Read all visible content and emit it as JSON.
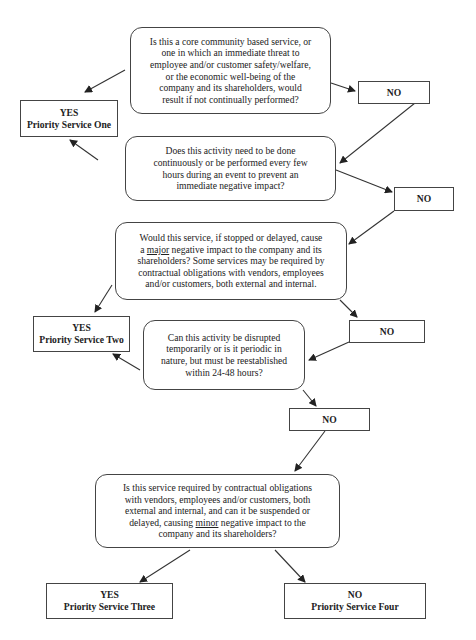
{
  "questions": [
    {
      "id": "q1",
      "lines": [
        "Is this a core community based service, or",
        "one in which an immediate threat to",
        "employee and/or customer safety/welfare,",
        "or the economic well-being of the",
        "company and its shareholders, would",
        "result if not continually performed?"
      ]
    },
    {
      "id": "q2",
      "lines": [
        "Does this activity need to be done",
        "continuously or be performed every few",
        "hours during an event to prevent an",
        "immediate negative impact?"
      ]
    },
    {
      "id": "q3",
      "line1_pre": "Would this service, if stopped or delayed, cause",
      "line2_a": "a ",
      "line2_u": "major",
      "line2_b": " negative impact to the company and its",
      "lines_rest": [
        "shareholders? Some services may be required by",
        "contractual obligations with vendors, employees",
        "and/or customers, both external and internal."
      ]
    },
    {
      "id": "q4",
      "lines": [
        "Can this activity be disrupted",
        "temporarily or is it periodic in",
        "nature, but must be reestablished",
        "within 24-48 hours?"
      ]
    },
    {
      "id": "q5",
      "lines_pre": [
        "Is this service required by contractual obligations",
        "with vendors, employees and/or customers, both",
        "external and internal, and can it be suspended or"
      ],
      "line4_a": "delayed, causing ",
      "line4_u": "minor",
      "line4_b": " negative impact to the",
      "line5": "company and its shareholders?"
    }
  ],
  "results": {
    "yes1": {
      "answer": "YES",
      "label": "Priority Service One"
    },
    "yes2": {
      "answer": "YES",
      "label": "Priority Service Two"
    },
    "yes3": {
      "answer": "YES",
      "label": "Priority Service Three"
    },
    "no5": {
      "answer": "NO",
      "label": "Priority Service Four"
    }
  },
  "no_boxes": {
    "no1": "NO",
    "no2": "NO",
    "no3": "NO",
    "no4": "NO"
  },
  "colors": {
    "line": "#333333",
    "border": "#444444",
    "background": "#ffffff"
  }
}
